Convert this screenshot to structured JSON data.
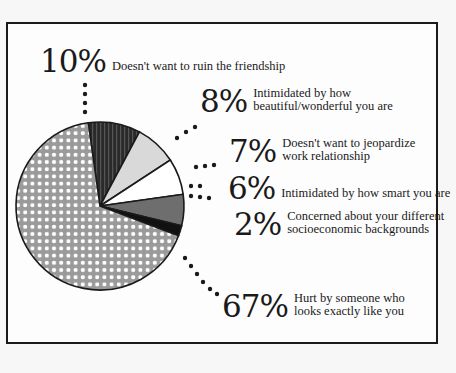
{
  "chart_data": {
    "type": "pie",
    "title": "",
    "start_angle_deg": -8,
    "direction": "clockwise",
    "slices": [
      {
        "label": "Doesn't want to ruin the friendship",
        "value": 10,
        "fill": "stripes-dark",
        "color": "#2a2a2a"
      },
      {
        "label": "Intimidated by how beautiful/wonderful you are",
        "value": 8,
        "fill": "solid",
        "color": "#d9d9d9"
      },
      {
        "label": "Doesn't want to jeopardize work relationship",
        "value": 7,
        "fill": "solid",
        "color": "#ffffff"
      },
      {
        "label": "Intimidated by how smart you are",
        "value": 6,
        "fill": "solid",
        "color": "#6e6e6e"
      },
      {
        "label": "Concerned about your different socioeconomic backgrounds",
        "value": 2,
        "fill": "solid",
        "color": "#111111"
      },
      {
        "label": "Hurt by someone who looks exactly like you",
        "value": 67,
        "fill": "dots",
        "color": "#9a9a9a"
      }
    ]
  },
  "labels": [
    {
      "pct": "10%",
      "lines": [
        "Doesn't want to ruin the friendship"
      ]
    },
    {
      "pct": "8%",
      "lines": [
        "Intimidated by how",
        "beautiful/wonderful you are"
      ]
    },
    {
      "pct": "7%",
      "lines": [
        "Doesn't want to jeopardize",
        "work relationship"
      ]
    },
    {
      "pct": "6%",
      "lines": [
        "Intimidated by how smart you are"
      ]
    },
    {
      "pct": "2%",
      "lines": [
        "Concerned about your different",
        "socioeconomic backgrounds"
      ]
    },
    {
      "pct": "67%",
      "lines": [
        "Hurt by someone who",
        "looks exactly like you"
      ]
    }
  ]
}
